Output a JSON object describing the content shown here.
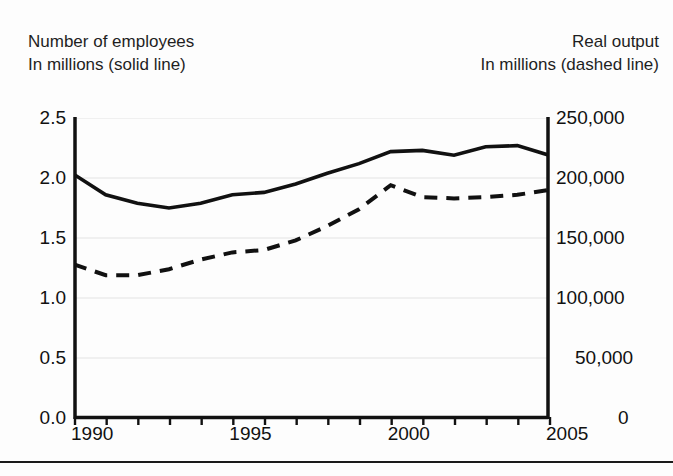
{
  "header": {
    "left_title": "Number of employees",
    "left_subtitle": "In millions (solid line)",
    "right_title": "Real output",
    "right_subtitle": "In millions (dashed line)"
  },
  "chart_data": {
    "type": "line",
    "title": "",
    "xlabel": "",
    "grid": true,
    "legend_position": "none",
    "x": [
      1990,
      1991,
      1992,
      1993,
      1994,
      1995,
      1996,
      1997,
      1998,
      1999,
      2000,
      2001,
      2002,
      2003,
      2004,
      2005
    ],
    "xlim": [
      1990,
      2005
    ],
    "xtick_labels": [
      "1990",
      "1995",
      "2000",
      "2005"
    ],
    "xtick_values": [
      1990,
      1995,
      2000,
      2005
    ],
    "xtick_all": [
      1990,
      1991,
      1992,
      1993,
      1994,
      1995,
      1996,
      1997,
      1998,
      1999,
      2000,
      2001,
      2002,
      2003,
      2004,
      2005
    ],
    "left_axis": {
      "label": "Number of employees In millions (solid line)",
      "ylim": [
        0.0,
        2.5
      ],
      "ytick_labels": [
        "2.5",
        "2.0",
        "1.5",
        "1.0",
        "0.5",
        "0.0"
      ],
      "ytick_values": [
        2.5,
        2.0,
        1.5,
        1.0,
        0.5,
        0.0
      ]
    },
    "right_axis": {
      "label": "Real output In millions (dashed line)",
      "ylim": [
        0,
        250000
      ],
      "ytick_labels": [
        "250,000",
        "200,000",
        "150,000",
        "100,000",
        "50,000",
        "0"
      ],
      "ytick_values": [
        250000,
        200000,
        150000,
        100000,
        50000,
        0
      ]
    },
    "series": [
      {
        "name": "Number of employees",
        "style": "solid",
        "axis": "left",
        "unit": "millions",
        "values": [
          2.03,
          1.86,
          1.79,
          1.75,
          1.79,
          1.86,
          1.88,
          1.95,
          2.04,
          2.12,
          2.22,
          2.23,
          2.19,
          2.26,
          2.27,
          2.19
        ]
      },
      {
        "name": "Real output",
        "style": "dashed",
        "axis": "right",
        "unit": "millions",
        "values": [
          128000,
          119000,
          119000,
          124000,
          132000,
          138000,
          140000,
          148000,
          160000,
          174000,
          194000,
          184000,
          183000,
          184000,
          186000,
          190000
        ]
      }
    ]
  },
  "colors": {
    "line": "#111111",
    "grid": "#f0f0f0",
    "axis": "#111111",
    "background": "#fdfdfd",
    "rule": "#1a1a1a"
  }
}
